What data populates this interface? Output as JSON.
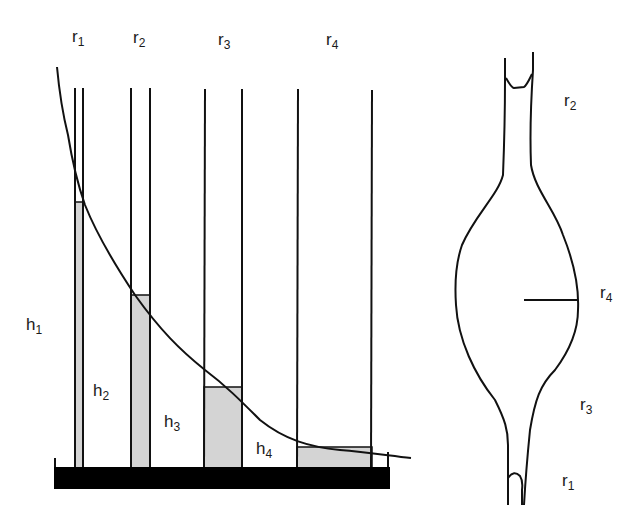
{
  "diagram": {
    "title": "",
    "left_panel": {
      "description": "Capillary tubes of increasing radius standing in a liquid trough; liquid column heights fall along a curve",
      "tube_labels": [
        {
          "id": "r1",
          "base": "r",
          "sub": "1"
        },
        {
          "id": "r2",
          "base": "r",
          "sub": "2"
        },
        {
          "id": "r3",
          "base": "r",
          "sub": "3"
        },
        {
          "id": "r4",
          "base": "r",
          "sub": "4"
        }
      ],
      "height_labels": [
        {
          "id": "h1",
          "base": "h",
          "sub": "1"
        },
        {
          "id": "h2",
          "base": "h",
          "sub": "2"
        },
        {
          "id": "h3",
          "base": "h",
          "sub": "3"
        },
        {
          "id": "h4",
          "base": "h",
          "sub": "4"
        }
      ],
      "tubes": [
        {
          "id": "r1",
          "x_left": 75,
          "x_right": 83,
          "column_top_y": 202
        },
        {
          "id": "r2",
          "x_left": 131,
          "x_right": 150,
          "column_top_y": 295
        },
        {
          "id": "r3",
          "x_left": 204,
          "x_right": 242,
          "column_top_y": 387
        },
        {
          "id": "r4",
          "x_left": 297,
          "x_right": 372,
          "column_top_y": 447
        }
      ],
      "trough": {
        "x": 54,
        "y": 467,
        "width": 336,
        "height": 22
      },
      "colors": {
        "liquid": "#d4d4d4",
        "line": "#111111",
        "trough": "#000000"
      }
    },
    "right_panel": {
      "description": "Bulb-shaped capillary vessel with narrow upper neck and lower stem; meniscus at each end",
      "labels": [
        {
          "id": "r2",
          "base": "r",
          "sub": "2"
        },
        {
          "id": "r4",
          "base": "r",
          "sub": "4"
        },
        {
          "id": "r3",
          "base": "r",
          "sub": "3"
        },
        {
          "id": "r1",
          "base": "r",
          "sub": "1"
        }
      ],
      "radius_marker": "r4 horizontal radius line at bulb equator"
    }
  }
}
